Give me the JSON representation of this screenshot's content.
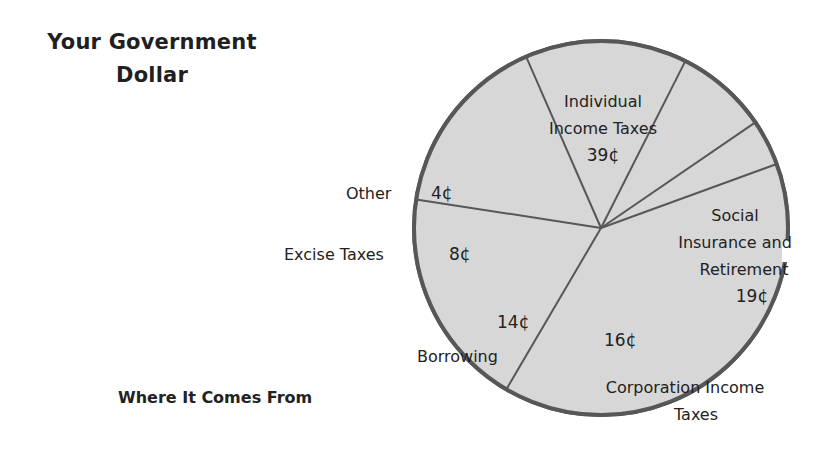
{
  "title": {
    "line1": "Your Government",
    "line2": "Dollar"
  },
  "subtitle": "Where It Comes From",
  "colors": {
    "fill": "#d7d7d7",
    "stroke": "#575757",
    "text": "#222222"
  },
  "chart_data": {
    "type": "pie",
    "title": "Your Government Dollar",
    "subtitle": "Where It Comes From",
    "unit": "cents",
    "categories": [
      "Individual Income Taxes",
      "Social Insurance and Retirement",
      "Corporation Income Taxes",
      "Borrowing",
      "Excise Taxes",
      "Other"
    ],
    "values": [
      39,
      19,
      16,
      14,
      8,
      4
    ],
    "value_labels": [
      "39¢",
      "19¢",
      "16¢",
      "14¢",
      "8¢",
      "4¢"
    ],
    "legend": "none (direct labels)",
    "start_angle_deg": -20,
    "direction": "clockwise"
  },
  "labels": {
    "individual": {
      "line1": "Individual",
      "line2": "Income Taxes",
      "value": "39¢"
    },
    "social": {
      "line1": "Social",
      "line2": "Insurance and",
      "line3": "Retirement",
      "value": "19¢"
    },
    "corporation": {
      "line1": "Corporation Income",
      "line2": "Taxes",
      "value": "16¢"
    },
    "borrowing": {
      "name": "Borrowing",
      "value": "14¢"
    },
    "excise": {
      "name": "Excise Taxes",
      "value": "8¢"
    },
    "other": {
      "name": "Other",
      "value": "4¢"
    }
  }
}
